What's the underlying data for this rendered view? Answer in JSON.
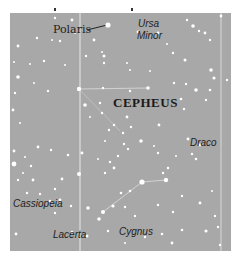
{
  "map": {
    "background_color": "#a8a8a8",
    "star_color": "#ffffff",
    "line_color": "#e0e0e0",
    "labels": {
      "polaris": "Polaris",
      "ursa_minor_1": "Ursa",
      "ursa_minor_2": "Minor",
      "cepheus": "CEPHEUS",
      "draco": "Draco",
      "cassiopeia": "Cassiopeia",
      "lacerta": "Lacerta",
      "cygnus": "Cygnus"
    }
  }
}
